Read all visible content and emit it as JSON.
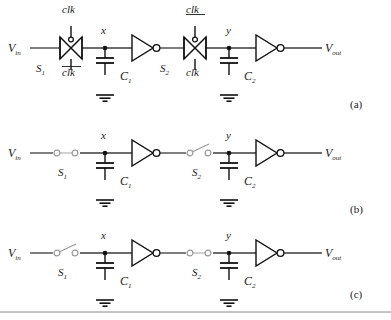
{
  "figure": {
    "background_color": "#ffffff",
    "wire_color": "#3a3a3a",
    "symbol_color": "#111111",
    "switch_color": "#9a9a9a",
    "width": 391,
    "height": 320
  },
  "labels": {
    "v_in": "V",
    "v_in_sub": "in",
    "v_out": "V",
    "v_out_sub": "out",
    "node_x": "x",
    "node_y": "y",
    "s1": "S",
    "s1_sub": "1",
    "s2": "S",
    "s2_sub": "2",
    "c1": "C",
    "c1_sub": "1",
    "c2": "C",
    "c2_sub": "2",
    "clk": "clk",
    "clk_bar": "clk"
  },
  "panels": [
    {
      "id": "a",
      "tag": "(a)",
      "switch_type": "transmission-gate",
      "s1": {
        "name": "S1",
        "top_label": "clk",
        "top_overbar": false,
        "bottom_label": "clk",
        "bottom_overbar": true,
        "state": "transmission-gate"
      },
      "s2": {
        "name": "S2",
        "top_label": "clk",
        "top_overbar": true,
        "bottom_label": "clk",
        "bottom_overbar": false,
        "state": "transmission-gate"
      }
    },
    {
      "id": "b",
      "tag": "(b)",
      "switch_type": "ideal-switch",
      "s1": {
        "name": "S1",
        "state": "closed"
      },
      "s2": {
        "name": "S2",
        "state": "open"
      }
    },
    {
      "id": "c",
      "tag": "(c)",
      "switch_type": "ideal-switch",
      "s1": {
        "name": "S1",
        "state": "open"
      },
      "s2": {
        "name": "S2",
        "state": "closed"
      }
    }
  ],
  "components": {
    "inverters": 6,
    "capacitors": 6,
    "grounds": 6,
    "transmission_gates": 2,
    "ideal_switches": 4
  }
}
